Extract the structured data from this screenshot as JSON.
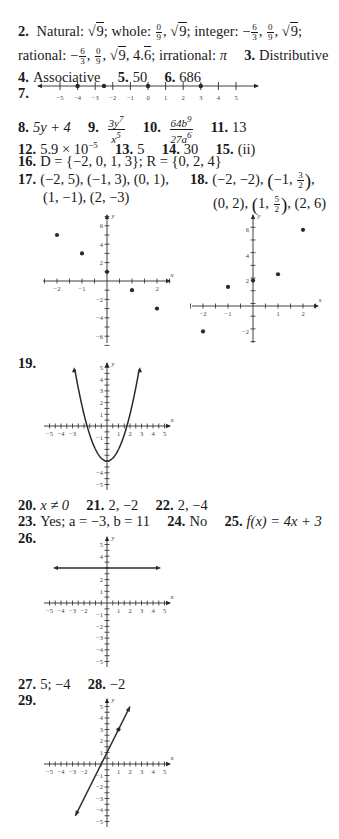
{
  "answers": {
    "a2": {
      "num": "2.",
      "natural_label": "Natural:",
      "natural": "9",
      "whole_label": "whole:",
      "whole_frac": {
        "num": "0",
        "den": "9"
      },
      "whole_sqrt": "9",
      "integer_label": "integer:",
      "integer_frac1": {
        "num": "6",
        "den": "3"
      },
      "integer_frac2": {
        "num": "0",
        "den": "9"
      },
      "integer_sqrt": "9",
      "rational_label": "rational:",
      "rational_frac1": {
        "num": "6",
        "den": "3"
      },
      "rational_frac2": {
        "num": "0",
        "den": "9"
      },
      "rational_sqrt": "9",
      "rational_decimal_int": "4.",
      "rational_decimal_repeat": "6",
      "irrational_label": "irrational:",
      "irrational": "π"
    },
    "a3": {
      "num": "3.",
      "text": "Distributive"
    },
    "a4": {
      "num": "4.",
      "text": "Associative"
    },
    "a5": {
      "num": "5.",
      "text": "50"
    },
    "a6": {
      "num": "6.",
      "text": "686"
    },
    "a7": {
      "num": "7."
    },
    "a8": {
      "num": "8.",
      "text": "5y + 4"
    },
    "a9": {
      "num": "9.",
      "frac_num": "3y",
      "frac_num_exp": "7",
      "frac_den": "x",
      "frac_den_exp": "5"
    },
    "a10": {
      "num": "10.",
      "frac_num": "64b",
      "frac_num_exp": "9",
      "frac_den": "27a",
      "frac_den_exp": "6"
    },
    "a11": {
      "num": "11.",
      "text": "13"
    },
    "a12": {
      "num": "12.",
      "text": "5.9 × 10",
      "exp": "−5"
    },
    "a13": {
      "num": "13.",
      "text": "5"
    },
    "a14": {
      "num": "14.",
      "text": "30"
    },
    "a15": {
      "num": "15.",
      "text": "(ii)"
    },
    "a16": {
      "num": "16.",
      "text": "D = {−2, 0, 1, 3}; R = {0, 2, 4}"
    },
    "a17": {
      "num": "17.",
      "line1": "(−2, 5), (−1, 3), (0, 1),",
      "line2": "(1, −1), (2, −3)"
    },
    "a18": {
      "num": "18.",
      "line1a": "(−2, −2), ",
      "line1b_pre": "−1, ",
      "line1b_frac": {
        "num": "3",
        "den": "2"
      },
      "line2a": "(0, 2), ",
      "line2b_pre": "1, ",
      "line2b_frac": {
        "num": "5",
        "den": "2"
      },
      "line2c": ", (2, 6)"
    },
    "a19": {
      "num": "19."
    },
    "a20": {
      "num": "20.",
      "text": "x ≠ 0"
    },
    "a21": {
      "num": "21.",
      "text": "2, −2"
    },
    "a22": {
      "num": "22.",
      "text": "2, −4"
    },
    "a23": {
      "num": "23.",
      "text": "Yes; a = −3, b = 11"
    },
    "a24": {
      "num": "24.",
      "text": "No"
    },
    "a25": {
      "num": "25.",
      "text": "f(x) = 4x + 3"
    },
    "a26": {
      "num": "26."
    },
    "a27": {
      "num": "27.",
      "text": "5; −4"
    },
    "a28": {
      "num": "28.",
      "text": "−2"
    },
    "a29": {
      "num": "29."
    }
  },
  "chart_data": [
    {
      "id": "q7-number-line",
      "type": "scatter",
      "title": "Number line",
      "xlabel": "",
      "ticks": [
        -5,
        -4,
        -3,
        -2,
        -1,
        0,
        1,
        2,
        3,
        4,
        5
      ],
      "points": [
        -4,
        -2.5,
        0,
        3
      ],
      "xlim": [
        -5.8,
        6
      ]
    },
    {
      "id": "q17-scatter",
      "type": "scatter",
      "xlabel": "x",
      "ylabel": "y",
      "x_ticks_labeled": [
        -2,
        -1,
        2
      ],
      "y_ticks_labeled": [
        6,
        4,
        2,
        -2,
        -4,
        -6
      ],
      "points": [
        [
          -2,
          5
        ],
        [
          -1,
          3
        ],
        [
          0,
          1
        ],
        [
          1,
          -1
        ],
        [
          2,
          -3
        ]
      ],
      "xlim": [
        -2.5,
        2.5
      ],
      "ylim": [
        -7,
        7
      ]
    },
    {
      "id": "q18-scatter",
      "type": "scatter",
      "xlabel": "x",
      "ylabel": "y",
      "x_ticks_labeled": [
        -2,
        -1,
        1,
        2
      ],
      "y_ticks_labeled": [
        6,
        4,
        2,
        -2
      ],
      "points": [
        [
          -2,
          -2
        ],
        [
          -1,
          1.5
        ],
        [
          0,
          2
        ],
        [
          1,
          2.5
        ],
        [
          2,
          6
        ]
      ],
      "xlim": [
        -2.5,
        2.5
      ],
      "ylim": [
        -3,
        7
      ]
    },
    {
      "id": "q19-parabola",
      "type": "line",
      "xlabel": "x",
      "ylabel": "y",
      "equation": "y = x^2 - 3",
      "x_ticks_labeled": [
        -5,
        -4,
        -3,
        1,
        2,
        3,
        4,
        5
      ],
      "y_ticks_labeled": [
        5,
        4,
        3,
        2,
        1,
        -1,
        -4,
        -5
      ],
      "xlim": [
        -5,
        5
      ],
      "ylim": [
        -5,
        5
      ],
      "x_range": [
        -2.8,
        2.8
      ]
    },
    {
      "id": "q26-horizontal-line",
      "type": "line",
      "xlabel": "x",
      "ylabel": "y",
      "equation": "y = 3",
      "x_ticks_labeled": [
        -5,
        -4,
        -3,
        -2,
        1,
        2,
        3,
        4,
        5
      ],
      "y_ticks_labeled": [
        5,
        4,
        2,
        1,
        -1,
        -2,
        -3,
        -4,
        -5
      ],
      "xlim": [
        -5,
        5
      ],
      "ylim": [
        -5,
        5
      ],
      "x_range": [
        -4.7,
        4.7
      ]
    },
    {
      "id": "q29-line",
      "type": "line",
      "xlabel": "x",
      "ylabel": "y",
      "equation": "y = 2x + 1",
      "highlight_point": [
        1,
        3
      ],
      "x_ticks_labeled": [
        -5,
        -4,
        -3,
        -2,
        1,
        2,
        3,
        4,
        5
      ],
      "y_ticks_labeled": [
        5,
        4,
        3,
        2,
        1,
        -1,
        -2,
        -3,
        -4,
        -5
      ],
      "xlim": [
        -5,
        5
      ],
      "ylim": [
        -5,
        5
      ],
      "x_range": [
        -2.75,
        2
      ]
    }
  ]
}
